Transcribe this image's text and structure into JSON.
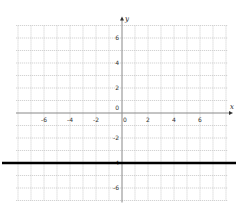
{
  "chart_data": {
    "type": "line",
    "title": "",
    "xlabel": "x",
    "ylabel": "y",
    "xlim": [
      -8,
      8
    ],
    "ylim": [
      -7,
      7
    ],
    "grid": true,
    "x_ticks": [
      -6,
      -4,
      -2,
      0,
      2,
      4,
      6
    ],
    "y_ticks": [
      6,
      4,
      2,
      0,
      -2,
      -4,
      -6
    ],
    "x_tick_labels": [
      "-6",
      "-4",
      "-2",
      "0",
      "2",
      "4",
      "6"
    ],
    "y_tick_labels": [
      "6",
      "4",
      "2",
      "0",
      "-2",
      "-4",
      "-6"
    ],
    "series": [
      {
        "name": "y = -4",
        "equation": "y = -4",
        "x": [
          -8,
          8
        ],
        "y": [
          -4,
          -4
        ],
        "color": "#000000",
        "style": "solid-bold"
      }
    ]
  },
  "colors": {
    "grid": "#c8c8c8",
    "axis": "#888888",
    "line": "#000000",
    "background": "#ffffff"
  }
}
